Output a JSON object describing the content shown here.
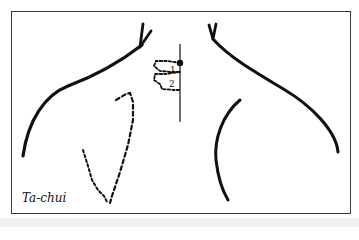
{
  "figure": {
    "caption": "Ta-chui",
    "point_labels": [
      "1",
      "2"
    ],
    "colors": {
      "ink": "#111111",
      "frame": "#3a3a3a",
      "background": "#ffffff",
      "band": "#f1f1f1"
    },
    "elements": [
      "left-shoulder-outline",
      "right-shoulder-outline",
      "right-arm-inner-outline",
      "scapula-dashed-outline",
      "vertebrae-dashed-outline",
      "spine-line",
      "acupoint-dot"
    ]
  }
}
